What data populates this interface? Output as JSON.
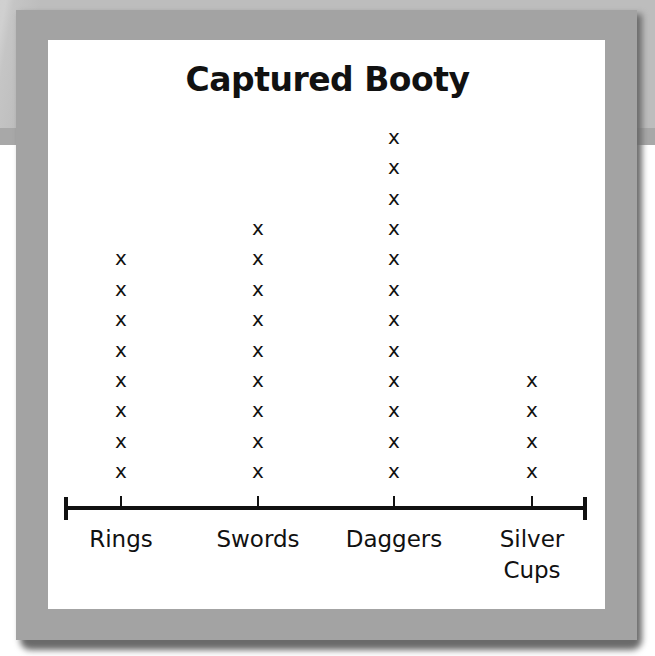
{
  "chart_data": {
    "type": "line-plot",
    "title": "Captured Booty",
    "xlabel": "",
    "ylabel": "",
    "marker": "x",
    "categories": [
      "Rings",
      "Swords",
      "Daggers",
      "Silver Cups"
    ],
    "category_label_lines": [
      [
        "Rings"
      ],
      [
        "Swords"
      ],
      [
        "Daggers"
      ],
      [
        "Silver",
        "Cups"
      ]
    ],
    "values": [
      8,
      9,
      12,
      4
    ],
    "grid": false,
    "legend": null
  },
  "labels": {
    "title": "Captured Booty",
    "cat0_line0": "Rings",
    "cat1_line0": "Swords",
    "cat2_line0": "Daggers",
    "cat3_line0": "Silver",
    "cat3_line1": "Cups",
    "mark": "x"
  },
  "colors": {
    "ink": "#111111",
    "panel": "#ffffff",
    "frame": "#a3a3a3",
    "background_band": "#bdbdbd"
  }
}
